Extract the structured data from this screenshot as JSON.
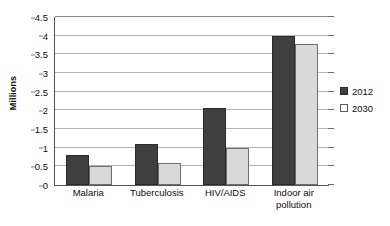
{
  "chart_data": {
    "type": "bar",
    "title": "",
    "subtitle": "",
    "xlabel": "",
    "ylabel": "Millions",
    "categories": [
      "Malaria",
      "Tuberculosis",
      "HIV/AIDS",
      "Indoor air pollution"
    ],
    "category_label_lines": [
      [
        "Malaria"
      ],
      [
        "Tuberculosis"
      ],
      [
        "HIV/AIDS"
      ],
      [
        "Indoor air",
        "pollution"
      ]
    ],
    "series": [
      {
        "name": "2012",
        "color": "#3f3f3f",
        "values": [
          0.8,
          1.1,
          2.05,
          3.98
        ]
      },
      {
        "name": "2030",
        "color": "#d9d9d9",
        "values": [
          0.5,
          0.58,
          1.0,
          3.78
        ]
      }
    ],
    "ylim": [
      0,
      4.5
    ],
    "ytick_values": [
      0,
      0.5,
      1,
      1.5,
      2,
      2.5,
      3,
      3.5,
      4,
      4.5
    ],
    "ytick_labels": [
      "0",
      "0.5",
      "1",
      "1.5",
      "2",
      "2.5",
      "3",
      "3.5",
      "4",
      "4.5"
    ],
    "grid": true,
    "grid_axis": "y",
    "legend_position": "right",
    "legend_entries": [
      "2012",
      "2030"
    ],
    "annotations": []
  },
  "colors": {
    "series_2012": "#3f3f3f",
    "series_2030": "#d9d9d9",
    "gridline": "#b4b4b4",
    "axis": "#555555",
    "text": "#0d0d0d",
    "background": "#ffffff"
  }
}
